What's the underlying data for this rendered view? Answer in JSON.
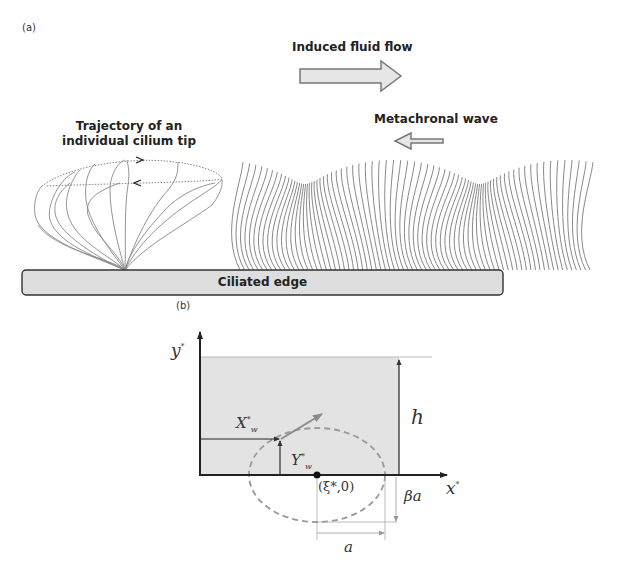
{
  "panel_a": {
    "label": "(a)",
    "induced_flow_label": "Induced fluid flow",
    "metachronal_label": "Metachronal wave",
    "trajectory_label_line1": "Trajectory of an",
    "trajectory_label_line2": "individual cilium tip",
    "edge_label": "Ciliated edge",
    "colors": {
      "arrow_fill": "#e6e6e6",
      "arrow_stroke": "#777777",
      "edge_fill": "#dedede",
      "edge_stroke": "#333333",
      "cilia_stroke": "#666666"
    }
  },
  "panel_b": {
    "label": "(b)",
    "y_axis_label": "y",
    "y_axis_sup": "*",
    "x_axis_label": "x",
    "x_axis_sup": "*",
    "Xw_label": "X",
    "Xw_sup": "*",
    "Xw_sub": "w",
    "Yw_label": "Y",
    "Yw_sup": "*",
    "Yw_sub": "w",
    "h_label": "h",
    "beta_a_label": "βa",
    "a_label": "a",
    "center_label": "(ξ*,0)",
    "colors": {
      "box_fill": "#e3e3e3",
      "axis": "#222222",
      "ellipse": "#999999",
      "vector": "#8a8a8a"
    }
  }
}
